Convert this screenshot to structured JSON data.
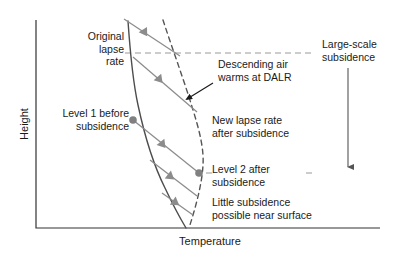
{
  "figure": {
    "background": "#ffffff"
  },
  "axes": {
    "y_title": "Height",
    "x_title": "Temperature",
    "axis_color": "#333333",
    "x_range_px": [
      36,
      380
    ],
    "y_range_px": [
      20,
      228
    ],
    "ticks": false,
    "grid": false
  },
  "labels": {
    "original_lapse_rate": "Original\nlapse\nrate",
    "descending_air": "Descending air\nwarms at DALR",
    "large_scale_subsidence": "Large-scale\nsubsidence",
    "level1_before": "Level 1 before\nsubsidence",
    "new_lapse_rate": "New lapse rate\nafter subsidence",
    "level2_after": "Level 2 after\nsubsidence",
    "little_subsidence": "Little subsidence\npossible near surface"
  },
  "curves": {
    "original_lapse_rate": {
      "name": "Original lapse rate",
      "style": "solid",
      "color": "#4d4d4d",
      "width": 1.3,
      "points": [
        [
          128,
          21
        ],
        [
          132,
          60
        ],
        [
          137,
          100
        ],
        [
          146,
          140
        ],
        [
          158,
          175
        ],
        [
          172,
          205
        ],
        [
          186,
          228
        ]
      ]
    },
    "new_lapse_rate": {
      "name": "New lapse rate after subsidence",
      "style": "dashed",
      "color": "#555555",
      "width": 1.4,
      "dash": "5,4",
      "points": [
        [
          163,
          20
        ],
        [
          176,
          60
        ],
        [
          190,
          100
        ],
        [
          200,
          140
        ],
        [
          203,
          163
        ],
        [
          200,
          185
        ],
        [
          194,
          207
        ],
        [
          189,
          228
        ]
      ]
    }
  },
  "transfer_lines": {
    "name": "Descending air parcel paths (DALR)",
    "color": "#8c8c8c",
    "width": 1.2,
    "marker": "triangle",
    "lines": [
      {
        "from": [
          124,
          19
        ],
        "to": [
          180,
          56
        ],
        "marker_at": [
          145,
          33
        ]
      },
      {
        "from": [
          133,
          57
        ],
        "to": [
          197,
          112
        ],
        "marker_at": [
          160,
          80
        ]
      },
      {
        "from": [
          133,
          120
        ],
        "to": [
          199,
          173
        ],
        "marker_at": [
          163,
          145
        ]
      },
      {
        "from": [
          150,
          160
        ],
        "to": [
          197,
          196
        ],
        "marker_at": [
          171,
          177
        ]
      },
      {
        "from": [
          162,
          193
        ],
        "to": [
          193,
          215
        ],
        "marker_at": [
          176,
          203
        ]
      }
    ]
  },
  "level_markers": [
    {
      "name": "Level 1 before subsidence",
      "x": 133,
      "y": 120,
      "color": "#808080",
      "r": 3.6
    },
    {
      "name": "Level 2 after subsidence",
      "x": 199,
      "y": 173,
      "color": "#808080",
      "r": 3.6
    }
  ],
  "dashed_guides": [
    {
      "name": "upper-level-guide",
      "y": 53,
      "x1": 105,
      "x2": 312,
      "color": "#999999",
      "dash": "6,4"
    },
    {
      "name": "lower-level-guide",
      "y": 173,
      "x1": 196,
      "x2": 312,
      "color": "#999999",
      "dash": "6,4"
    }
  ],
  "subsidence_arrow": {
    "name": "Large-scale subsidence arrow",
    "x": 348,
    "y1": 68,
    "y2": 172,
    "color": "#555555",
    "direction": "down"
  },
  "descending_arrow": {
    "name": "Descending air pointer",
    "from": [
      212,
      84
    ],
    "to": [
      185,
      100
    ],
    "color": "#1a1a1a"
  }
}
